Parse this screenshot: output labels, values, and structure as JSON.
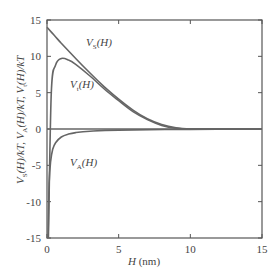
{
  "chart_data": {
    "type": "line",
    "title": "",
    "xlabel": "H (nm)",
    "ylabel": "V_S(H)/kT, V_A(H)/kT, V_t(H)/kT",
    "xlim": [
      0,
      15
    ],
    "ylim": [
      -15,
      15
    ],
    "xticks": [
      0,
      5,
      10,
      15
    ],
    "yticks": [
      -15,
      -10,
      -5,
      0,
      5,
      10,
      15
    ],
    "grid": false,
    "legend": "inline labels",
    "series": [
      {
        "name": "V_S(H)",
        "label": "VS(H)",
        "x": [
          0,
          0.5,
          1,
          2,
          3,
          4,
          5,
          6,
          7,
          8,
          9,
          10,
          12,
          15
        ],
        "y": [
          14,
          12.9,
          11.8,
          9.7,
          7.7,
          5.8,
          4.1,
          2.6,
          1.4,
          0.6,
          0.15,
          0,
          0,
          0
        ]
      },
      {
        "name": "V_t(H)",
        "label": "Vt(H)",
        "x": [
          0.1,
          0.3,
          0.6,
          1,
          1.5,
          2,
          3,
          4,
          5,
          6,
          7,
          8,
          9,
          10,
          12,
          15
        ],
        "y": [
          -15,
          5,
          8.8,
          9.7,
          9.5,
          8.9,
          7.3,
          5.5,
          3.9,
          2.4,
          1.3,
          0.5,
          0.1,
          0,
          0,
          0
        ]
      },
      {
        "name": "V_A(H)",
        "label": "VA(H)",
        "x": [
          0.08,
          0.15,
          0.25,
          0.4,
          0.6,
          1,
          1.5,
          2,
          3,
          5,
          10,
          15
        ],
        "y": [
          -15,
          -7.5,
          -4.5,
          -2.8,
          -1.9,
          -1.1,
          -0.7,
          -0.5,
          -0.3,
          -0.15,
          -0.05,
          -0.02
        ]
      },
      {
        "name": "zero line",
        "x": [
          0,
          15
        ],
        "y": [
          0,
          0
        ]
      }
    ],
    "annotations": [
      {
        "text": "VS(H)",
        "x": 2.7,
        "y": 11.5
      },
      {
        "text": "Vt(H)",
        "x": 1.6,
        "y": 6.0
      },
      {
        "text": "VA(H)",
        "x": 1.6,
        "y": -5.0
      }
    ]
  },
  "labels": {
    "x_title": "H",
    "x_unit": " (nm)",
    "vs_main": "V",
    "vs_sub": "S",
    "vt_main": "V",
    "vt_sub": "t",
    "va_main": "V",
    "va_sub": "A",
    "paren": "(H)"
  },
  "colors": {
    "line": "#666666",
    "frame": "#555555",
    "text": "#444444"
  }
}
